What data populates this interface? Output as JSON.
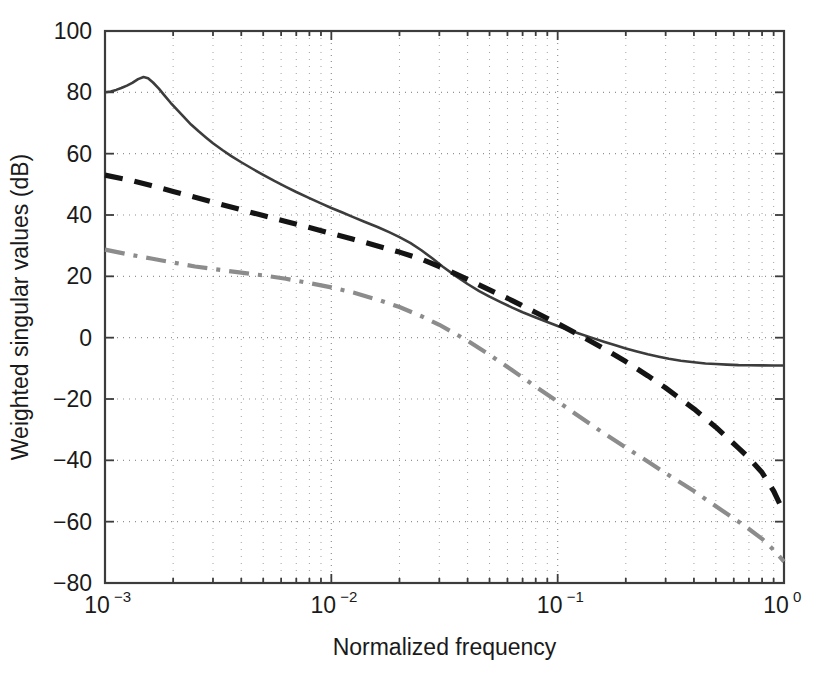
{
  "figure": {
    "background_color": "#ffffff",
    "plot_area": {
      "left": 105,
      "top": 31,
      "right": 784,
      "bottom": 583
    },
    "axis_color": "#3c3c3c",
    "grid_color": "#8c8c8c"
  },
  "axes": {
    "x": {
      "label": "Normalized frequency",
      "scale": "log",
      "min": 0.001,
      "max": 1.0,
      "tick_values": [
        0.001,
        0.01,
        0.1,
        1
      ],
      "tick_labels": [
        {
          "base": "10",
          "exp": "-3"
        },
        {
          "base": "10",
          "exp": "-2"
        },
        {
          "base": "10",
          "exp": "-1"
        },
        {
          "base": "10",
          "exp": "0"
        }
      ]
    },
    "y": {
      "label": "Weighted singular values (dB)",
      "scale": "linear",
      "min": -80,
      "max": 100,
      "step": 20,
      "tick_labels": [
        "100",
        "80",
        "60",
        "40",
        "20",
        "0",
        "−20",
        "−40",
        "−60",
        "−80"
      ],
      "tick_values": [
        100,
        80,
        60,
        40,
        20,
        0,
        -20,
        -40,
        -60,
        -80
      ]
    }
  },
  "chart_data": {
    "type": "line",
    "title": "",
    "xlabel": "Normalized frequency",
    "ylabel": "Weighted singular values (dB)",
    "xscale": "log",
    "xlim": [
      0.001,
      1.0
    ],
    "ylim": [
      -80,
      100
    ],
    "grid": true,
    "grid_style": "dotted",
    "legend": "none",
    "series": [
      {
        "name": "solid-curve",
        "style": "solid",
        "color": "#3c3c3c",
        "width": 2.6,
        "points": [
          [
            0.001,
            80.0
          ],
          [
            0.00106,
            80.3
          ],
          [
            0.00112,
            80.8
          ],
          [
            0.00118,
            81.4
          ],
          [
            0.00125,
            82.2
          ],
          [
            0.00132,
            83.1
          ],
          [
            0.0014,
            84.3
          ],
          [
            0.00148,
            85.0
          ],
          [
            0.00155,
            84.6
          ],
          [
            0.00163,
            83.2
          ],
          [
            0.00173,
            81.2
          ],
          [
            0.00183,
            79.0
          ],
          [
            0.00195,
            76.6
          ],
          [
            0.00209,
            74.2
          ],
          [
            0.00224,
            71.8
          ],
          [
            0.0024,
            69.5
          ],
          [
            0.0026,
            67.2
          ],
          [
            0.0028,
            65.2
          ],
          [
            0.003,
            63.4
          ],
          [
            0.0033,
            61.2
          ],
          [
            0.0036,
            59.3
          ],
          [
            0.004,
            57.2
          ],
          [
            0.0045,
            55.0
          ],
          [
            0.005,
            53.1
          ],
          [
            0.0056,
            51.1
          ],
          [
            0.0063,
            49.2
          ],
          [
            0.007,
            47.5
          ],
          [
            0.008,
            45.5
          ],
          [
            0.009,
            43.8
          ],
          [
            0.01,
            42.3
          ],
          [
            0.0112,
            40.8
          ],
          [
            0.0125,
            39.3
          ],
          [
            0.014,
            37.8
          ],
          [
            0.016,
            36.1
          ],
          [
            0.018,
            34.4
          ],
          [
            0.02,
            32.8
          ],
          [
            0.0224,
            30.8
          ],
          [
            0.025,
            28.5
          ],
          [
            0.028,
            25.8
          ],
          [
            0.031,
            23.2
          ],
          [
            0.035,
            20.4
          ],
          [
            0.04,
            17.5
          ],
          [
            0.045,
            15.2
          ],
          [
            0.05,
            13.4
          ],
          [
            0.056,
            11.6
          ],
          [
            0.063,
            9.8
          ],
          [
            0.07,
            8.3
          ],
          [
            0.08,
            6.6
          ],
          [
            0.09,
            5.1
          ],
          [
            0.1,
            3.8
          ],
          [
            0.112,
            2.5
          ],
          [
            0.125,
            1.3
          ],
          [
            0.14,
            0.1
          ],
          [
            0.16,
            -1.3
          ],
          [
            0.18,
            -2.5
          ],
          [
            0.2,
            -3.5
          ],
          [
            0.224,
            -4.5
          ],
          [
            0.25,
            -5.4
          ],
          [
            0.28,
            -6.2
          ],
          [
            0.31,
            -6.9
          ],
          [
            0.35,
            -7.5
          ],
          [
            0.4,
            -8.0
          ],
          [
            0.45,
            -8.4
          ],
          [
            0.5,
            -8.6
          ],
          [
            0.56,
            -8.8
          ],
          [
            0.63,
            -8.95
          ],
          [
            0.7,
            -9.0
          ],
          [
            0.8,
            -9.05
          ],
          [
            0.9,
            -9.1
          ],
          [
            1.0,
            -9.1
          ]
        ]
      },
      {
        "name": "dashed-curve",
        "style": "dashed",
        "color": "#141414",
        "width": 5.2,
        "dasharray": "18 12",
        "points": [
          [
            0.001,
            53.0
          ],
          [
            0.0013,
            51.3
          ],
          [
            0.0016,
            49.6
          ],
          [
            0.002,
            47.7
          ],
          [
            0.0025,
            45.8
          ],
          [
            0.003,
            44.2
          ],
          [
            0.004,
            41.7
          ],
          [
            0.005,
            39.8
          ],
          [
            0.0063,
            37.9
          ],
          [
            0.008,
            35.9
          ],
          [
            0.01,
            34.0
          ],
          [
            0.0125,
            32.1
          ],
          [
            0.016,
            29.9
          ],
          [
            0.02,
            27.9
          ],
          [
            0.025,
            25.6
          ],
          [
            0.03,
            23.2
          ],
          [
            0.04,
            19.0
          ],
          [
            0.05,
            15.6
          ],
          [
            0.063,
            12.1
          ],
          [
            0.08,
            8.2
          ],
          [
            0.1,
            4.6
          ],
          [
            0.125,
            0.8
          ],
          [
            0.16,
            -3.6
          ],
          [
            0.2,
            -7.8
          ],
          [
            0.25,
            -12.4
          ],
          [
            0.3,
            -16.4
          ],
          [
            0.4,
            -23.2
          ],
          [
            0.5,
            -29.2
          ],
          [
            0.63,
            -36.0
          ],
          [
            0.7,
            -39.2
          ],
          [
            0.8,
            -44.0
          ],
          [
            0.9,
            -50.0
          ],
          [
            1.0,
            -57.0
          ]
        ]
      },
      {
        "name": "dash-dot-curve",
        "style": "dashdot",
        "color": "#8c8c8c",
        "width": 4.2,
        "dasharray": "20 9 4 9",
        "points": [
          [
            0.001,
            28.7
          ],
          [
            0.0013,
            27.0
          ],
          [
            0.0016,
            25.8
          ],
          [
            0.002,
            24.5
          ],
          [
            0.0025,
            23.2
          ],
          [
            0.003,
            22.4
          ],
          [
            0.004,
            21.2
          ],
          [
            0.005,
            20.3
          ],
          [
            0.0063,
            19.2
          ],
          [
            0.008,
            17.8
          ],
          [
            0.01,
            16.4
          ],
          [
            0.0125,
            14.7
          ],
          [
            0.016,
            12.4
          ],
          [
            0.02,
            10.0
          ],
          [
            0.025,
            7.0
          ],
          [
            0.03,
            4.2
          ],
          [
            0.04,
            -1.0
          ],
          [
            0.05,
            -5.6
          ],
          [
            0.063,
            -10.6
          ],
          [
            0.08,
            -16.0
          ],
          [
            0.1,
            -20.8
          ],
          [
            0.125,
            -25.8
          ],
          [
            0.16,
            -31.2
          ],
          [
            0.2,
            -35.8
          ],
          [
            0.25,
            -40.4
          ],
          [
            0.3,
            -44.2
          ],
          [
            0.4,
            -50.0
          ],
          [
            0.5,
            -55.0
          ],
          [
            0.63,
            -60.0
          ],
          [
            0.7,
            -62.4
          ],
          [
            0.8,
            -65.6
          ],
          [
            0.9,
            -69.2
          ],
          [
            1.0,
            -73.0
          ]
        ]
      }
    ]
  }
}
